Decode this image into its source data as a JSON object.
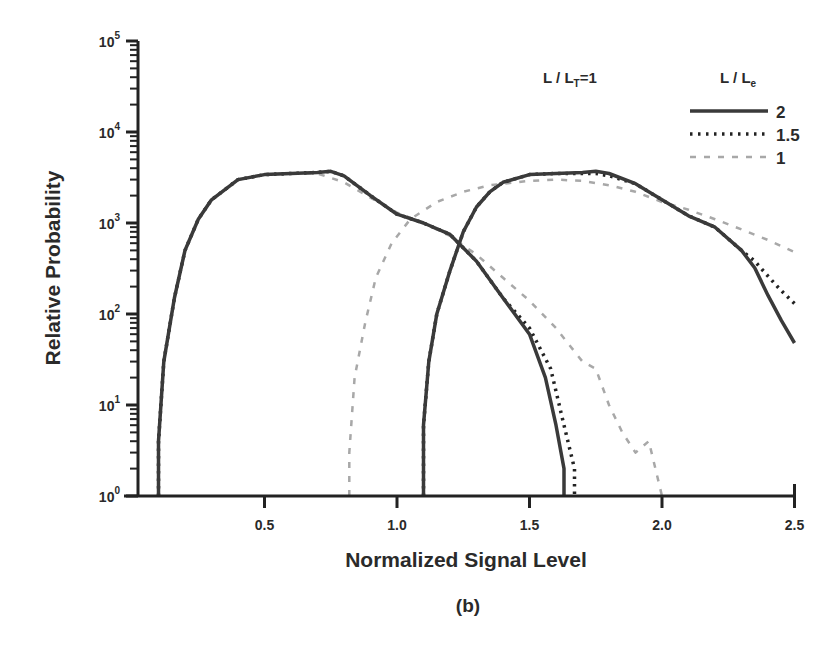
{
  "chart_data": {
    "type": "line",
    "title": "",
    "panel_label": "(b)",
    "xlabel": "Normalized Signal Level",
    "ylabel": "Relative Probability",
    "xlim": [
      0.0,
      2.5
    ],
    "ylim": [
      1,
      100000
    ],
    "yscale": "log",
    "x_ticks": [
      "0.5",
      "1.0",
      "1.5",
      "2.0",
      "2.5"
    ],
    "x_tick_values": [
      0.5,
      1.0,
      1.5,
      2.0,
      2.5
    ],
    "y_ticks": [
      {
        "base": "10",
        "exp": "0"
      },
      {
        "base": "10",
        "exp": "1"
      },
      {
        "base": "10",
        "exp": "2"
      },
      {
        "base": "10",
        "exp": "3"
      },
      {
        "base": "10",
        "exp": "4"
      },
      {
        "base": "10",
        "exp": "5"
      }
    ],
    "grid": false,
    "annotation": {
      "text_main": "L / L",
      "text_sub": "T",
      "text_tail": "=1"
    },
    "legend": {
      "title_main": "L / L",
      "title_sub": "e",
      "position": "upper right",
      "entries": [
        {
          "label": "2",
          "style": "solid",
          "color": "#3a3a3a"
        },
        {
          "label": "1.5",
          "style": "dotted",
          "color": "#222222"
        },
        {
          "label": "1",
          "style": "dashed",
          "color": "#a8a8a8"
        }
      ]
    },
    "series": [
      {
        "name": "L/Le=2 (low-signal distribution)",
        "style": "solid",
        "x": [
          0.1,
          0.1,
          0.12,
          0.16,
          0.2,
          0.25,
          0.3,
          0.4,
          0.5,
          0.6,
          0.7,
          0.75,
          0.8,
          0.9,
          1.0,
          1.1,
          1.2,
          1.3,
          1.4,
          1.5,
          1.56,
          1.6,
          1.63,
          1.63
        ],
        "y": [
          1,
          4,
          30,
          150,
          500,
          1100,
          1800,
          3000,
          3400,
          3500,
          3600,
          3700,
          3300,
          2000,
          1250,
          1000,
          750,
          380,
          150,
          60,
          20,
          6,
          2,
          1
        ]
      },
      {
        "name": "L/Le=1.5 (low-signal distribution)",
        "style": "dotted",
        "x": [
          0.1,
          0.1,
          0.12,
          0.16,
          0.2,
          0.25,
          0.3,
          0.4,
          0.5,
          0.6,
          0.7,
          0.75,
          0.8,
          0.9,
          1.0,
          1.1,
          1.2,
          1.3,
          1.4,
          1.5,
          1.58,
          1.63,
          1.67,
          1.67
        ],
        "y": [
          1,
          4,
          30,
          150,
          500,
          1100,
          1800,
          3000,
          3400,
          3500,
          3600,
          3700,
          3300,
          2000,
          1250,
          1000,
          750,
          380,
          150,
          70,
          25,
          6,
          2,
          1
        ]
      },
      {
        "name": "L/Le=1 (low-signal distribution)",
        "style": "dashed",
        "x": [
          0.1,
          0.1,
          0.12,
          0.16,
          0.2,
          0.25,
          0.3,
          0.4,
          0.5,
          0.6,
          0.7,
          0.8,
          0.9,
          1.0,
          1.1,
          1.2,
          1.3,
          1.4,
          1.5,
          1.6,
          1.7,
          1.75,
          1.8,
          1.85,
          1.9,
          1.95,
          2.0
        ],
        "y": [
          1,
          4,
          30,
          150,
          500,
          1100,
          1800,
          3000,
          3400,
          3500,
          3500,
          2800,
          1900,
          1300,
          1000,
          720,
          450,
          250,
          140,
          70,
          30,
          25,
          10,
          5,
          3,
          4,
          1
        ]
      },
      {
        "name": "L/Le=2 (high-signal distribution)",
        "style": "solid",
        "x": [
          1.1,
          1.1,
          1.12,
          1.15,
          1.2,
          1.25,
          1.3,
          1.35,
          1.4,
          1.5,
          1.6,
          1.7,
          1.75,
          1.8,
          1.9,
          2.0,
          2.1,
          2.2,
          2.3,
          2.35,
          2.4,
          2.45,
          2.5
        ],
        "y": [
          1,
          6,
          30,
          100,
          300,
          800,
          1500,
          2200,
          2800,
          3400,
          3500,
          3600,
          3700,
          3500,
          2700,
          1800,
          1200,
          900,
          500,
          320,
          160,
          85,
          48
        ]
      },
      {
        "name": "L/Le=1.5 (high-signal distribution)",
        "style": "dotted",
        "x": [
          1.1,
          1.1,
          1.12,
          1.15,
          1.2,
          1.25,
          1.3,
          1.35,
          1.4,
          1.5,
          1.6,
          1.7,
          1.75,
          1.8,
          1.9,
          2.0,
          2.1,
          2.2,
          2.3,
          2.35,
          2.4,
          2.45,
          2.5
        ],
        "y": [
          1,
          6,
          30,
          100,
          300,
          800,
          1500,
          2200,
          2800,
          3400,
          3500,
          3500,
          3500,
          3300,
          2700,
          1800,
          1200,
          900,
          500,
          380,
          260,
          180,
          130
        ]
      },
      {
        "name": "L/Le=1 (high-signal distribution)",
        "style": "dashed",
        "x": [
          0.82,
          0.82,
          0.84,
          0.88,
          0.92,
          0.98,
          1.05,
          1.15,
          1.25,
          1.35,
          1.5,
          1.6,
          1.7,
          1.8,
          1.9,
          2.0,
          2.1,
          2.2,
          2.3,
          2.4,
          2.5
        ],
        "y": [
          1,
          3,
          20,
          80,
          250,
          600,
          1100,
          1700,
          2200,
          2600,
          2900,
          3000,
          2900,
          2600,
          2200,
          1700,
          1400,
          1100,
          850,
          650,
          480
        ]
      }
    ]
  }
}
